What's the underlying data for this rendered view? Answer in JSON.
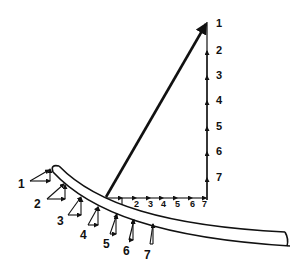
{
  "diagram": {
    "colors": {
      "ink": "#111111",
      "background": "#ffffff"
    },
    "vertical_axis_labels": [
      "1",
      "2",
      "3",
      "4",
      "5",
      "6",
      "7"
    ],
    "horizontal_axis_labels": [
      "2",
      "3",
      "4",
      "5",
      "6",
      "7"
    ],
    "beam_point_labels": [
      "1",
      "2",
      "3",
      "4",
      "5",
      "6",
      "7"
    ]
  }
}
